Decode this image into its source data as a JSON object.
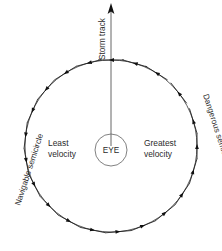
{
  "diagram": {
    "title_label": "Storm track",
    "center_label": "EYE",
    "left_side_label": "Navigable semicircle",
    "right_side_label": "Dangerous semicircle",
    "left_inner_label_line1": "Least",
    "left_inner_label_line2": "velocity",
    "right_inner_label_line1": "Greatest",
    "right_inner_label_line2": "velocity",
    "colors": {
      "background": "#ffffff",
      "text": "#2b2b2b",
      "circle": "#4a4a4a",
      "arrow": "#111111",
      "track": "#555555"
    },
    "geometry": {
      "center_x": 111,
      "center_y": 146,
      "outer_radius": 86,
      "eye_radius": 16,
      "track_top_y": 6,
      "rotation": "counterclockwise"
    },
    "wind_arrows": [
      {
        "angle_deg": 90,
        "name": "wind-arrow-top"
      },
      {
        "angle_deg": 105,
        "name": "wind-arrow-top-left-1"
      },
      {
        "angle_deg": 122,
        "name": "wind-arrow-top-left-2"
      },
      {
        "angle_deg": 139,
        "name": "wind-arrow-upper-left"
      },
      {
        "angle_deg": 156,
        "name": "wind-arrow-left-upper"
      },
      {
        "angle_deg": 173,
        "name": "wind-arrow-left"
      },
      {
        "angle_deg": 190,
        "name": "wind-arrow-left-lower"
      },
      {
        "angle_deg": 207,
        "name": "wind-arrow-lower-left"
      },
      {
        "angle_deg": 224,
        "name": "wind-arrow-bottom-left-2"
      },
      {
        "angle_deg": 241,
        "name": "wind-arrow-bottom-left-1"
      },
      {
        "angle_deg": 258,
        "name": "wind-arrow-bottom"
      },
      {
        "angle_deg": 275,
        "name": "wind-arrow-bottom-right-1"
      },
      {
        "angle_deg": 292,
        "name": "wind-arrow-bottom-right-2"
      },
      {
        "angle_deg": 309,
        "name": "wind-arrow-lower-right"
      },
      {
        "angle_deg": 326,
        "name": "wind-arrow-right-lower"
      },
      {
        "angle_deg": 343,
        "name": "wind-arrow-right"
      },
      {
        "angle_deg": 360,
        "name": "wind-arrow-right-upper"
      },
      {
        "angle_deg": 17,
        "name": "wind-arrow-upper-right"
      },
      {
        "angle_deg": 38,
        "name": "wind-arrow-top-right-2"
      },
      {
        "angle_deg": 58,
        "name": "wind-arrow-top-right-1"
      },
      {
        "angle_deg": 74,
        "name": "wind-arrow-top-right-0"
      }
    ]
  }
}
